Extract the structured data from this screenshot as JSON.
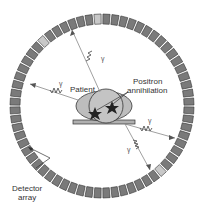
{
  "diagram": {
    "labels": {
      "patient": "Patient",
      "positron_line1": "Positron",
      "positron_line2": "annihilation",
      "detector_line1": "Detector",
      "detector_line2": "array"
    },
    "gamma_symbol": "γ",
    "colors": {
      "detector_block": "#7a7a7a",
      "detector_block_highlight": "#c8c8c8",
      "patient_fill": "#bdbdbd",
      "table_fill": "#b0b0b0",
      "outline": "#333333"
    }
  }
}
